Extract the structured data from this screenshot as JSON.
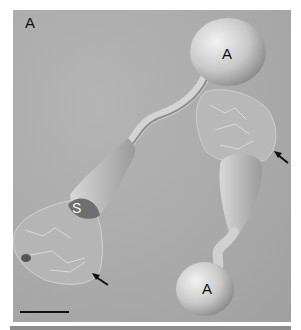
{
  "figure": {
    "panel_label": "A",
    "labels": {
      "cell_top": "A",
      "cell_bottom": "A",
      "cell_s": "S"
    },
    "arrows": [
      {
        "name": "arrow-right",
        "tip": [
          274,
          151
        ],
        "tail": [
          288,
          163
        ]
      },
      {
        "name": "arrow-bottom-left",
        "tip": [
          92,
          273
        ],
        "tail": [
          108,
          285
        ]
      }
    ],
    "scale_bar": {
      "x1": 20,
      "x2": 69,
      "y": 312
    },
    "colors": {
      "background": "#a9a9a9",
      "cell_light": "#e6e6e6",
      "cell_dark": "#8a8a8a",
      "text": "#111111"
    }
  }
}
